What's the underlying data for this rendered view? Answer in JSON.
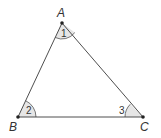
{
  "diagram": {
    "type": "triangle",
    "colors": {
      "line": "#3a3a3a",
      "angle_fill": "#e6e6e6",
      "angle_stroke": "#555555",
      "text": "#333333",
      "background": "#ffffff"
    },
    "vertices": [
      {
        "id": "A",
        "label": "A",
        "x": 62,
        "y": 23
      },
      {
        "id": "B",
        "label": "B",
        "x": 18,
        "y": 117
      },
      {
        "id": "C",
        "label": "C",
        "x": 143,
        "y": 117
      }
    ],
    "angles": [
      {
        "vertex": "A",
        "label": "1"
      },
      {
        "vertex": "B",
        "label": "2"
      },
      {
        "vertex": "C",
        "label": "3"
      }
    ]
  }
}
